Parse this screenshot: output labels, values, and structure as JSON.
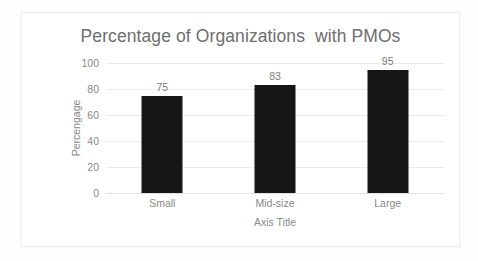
{
  "chart_data": {
    "type": "bar",
    "title": "Percentage of Organizations  with PMOs",
    "categories": [
      "Small",
      "Mid-size",
      "Large"
    ],
    "values": [
      75,
      83,
      95
    ],
    "data_labels": [
      "75",
      "83",
      "95"
    ],
    "xlabel": "Axis Title",
    "ylabel": "Percengage",
    "ylim": [
      0,
      100
    ],
    "yticks": [
      0,
      20,
      40,
      60,
      80,
      100
    ],
    "ytick_labels": [
      "0",
      "20",
      "40",
      "60",
      "80",
      "100"
    ],
    "grid": true,
    "legend": false,
    "series": [
      {
        "name": "Percengage",
        "values": [
          75,
          83,
          95
        ],
        "color": "#161616"
      }
    ],
    "colors": {
      "bar": "#161616",
      "gridline": "#ececec",
      "axis_text": "#8a8a8a",
      "title_text": "#6e6e6e",
      "data_label_text": "#7d7d7d",
      "plot_background": "#ffffff",
      "page_background": "#fdfdfd",
      "frame_border": "#efefef"
    }
  }
}
